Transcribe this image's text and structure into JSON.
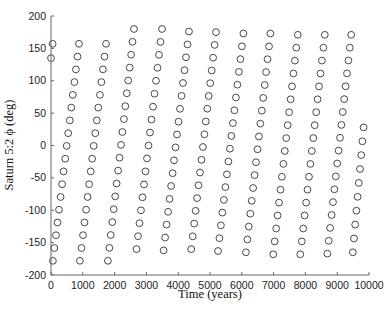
{
  "chart_data": {
    "type": "scatter",
    "title": "",
    "xlabel": "Time (years)",
    "ylabel": "Saturn 5:2 ϕ (deg)",
    "xlim": [
      0,
      10000
    ],
    "ylim": [
      -200,
      200
    ],
    "xticks": [
      0,
      1000,
      2000,
      3000,
      4000,
      5000,
      6000,
      7000,
      8000,
      9000,
      10000
    ],
    "yticks": [
      -200,
      -150,
      -100,
      -50,
      0,
      50,
      100,
      150,
      200
    ],
    "grid": false,
    "legend": null,
    "marker": "open-circle",
    "marker_color": "#333333",
    "columns": [
      {
        "t_start": 0,
        "phi_start": 135,
        "t_end": 50,
        "phi_end": 157,
        "n": 2
      },
      {
        "t_start": 60,
        "phi_start": -178,
        "t_end": 880,
        "phi_end": 157,
        "n": 18
      },
      {
        "t_start": 910,
        "phi_start": -178,
        "t_end": 1730,
        "phi_end": 157,
        "n": 18
      },
      {
        "t_start": 1790,
        "phi_start": -178,
        "t_end": 2610,
        "phi_end": 180,
        "n": 19
      },
      {
        "t_start": 2690,
        "phi_start": -160,
        "t_end": 3490,
        "phi_end": 180,
        "n": 18
      },
      {
        "t_start": 3540,
        "phi_start": -162,
        "t_end": 4340,
        "phi_end": 176,
        "n": 18
      },
      {
        "t_start": 4410,
        "phi_start": -160,
        "t_end": 5190,
        "phi_end": 175,
        "n": 18
      },
      {
        "t_start": 5250,
        "phi_start": -163,
        "t_end": 6050,
        "phi_end": 173,
        "n": 18
      },
      {
        "t_start": 6130,
        "phi_start": -165,
        "t_end": 6900,
        "phi_end": 173,
        "n": 18
      },
      {
        "t_start": 6990,
        "phi_start": -168,
        "t_end": 7760,
        "phi_end": 171,
        "n": 18
      },
      {
        "t_start": 7840,
        "phi_start": -168,
        "t_end": 8610,
        "phi_end": 171,
        "n": 18
      },
      {
        "t_start": 8690,
        "phi_start": -167,
        "t_end": 9440,
        "phi_end": 171,
        "n": 18
      },
      {
        "t_start": 9490,
        "phi_start": -165,
        "t_end": 9830,
        "phi_end": 28,
        "n": 10
      }
    ]
  }
}
